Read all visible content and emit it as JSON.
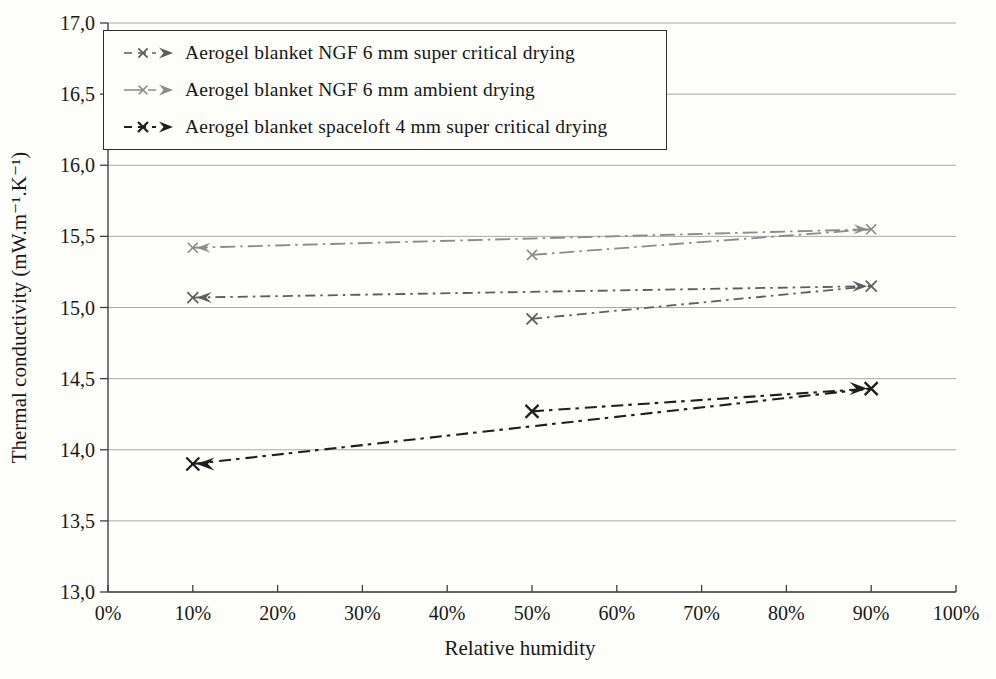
{
  "chart_data": {
    "type": "line",
    "title": "",
    "xlabel": "Relative humidity",
    "ylabel": "Thermal conductivity (mW.m⁻¹.K⁻¹)",
    "xlim": [
      0,
      100
    ],
    "ylim": [
      13.0,
      17.0
    ],
    "grid": "horizontal",
    "legend_position": "top-left",
    "x_ticks": {
      "values": [
        0,
        10,
        20,
        30,
        40,
        50,
        60,
        70,
        80,
        90,
        100
      ],
      "labels": [
        "0%",
        "10%",
        "20%",
        "30%",
        "40%",
        "50%",
        "60%",
        "70%",
        "80%",
        "90%",
        "100%"
      ]
    },
    "y_ticks": {
      "values": [
        17.0,
        16.5,
        16.0,
        15.5,
        15.0,
        14.5,
        14.0,
        13.5,
        13.0
      ],
      "labels": [
        "17,0",
        "16,5",
        "16,0",
        "15,5",
        "15,0",
        "14,5",
        "14,0",
        "13,5",
        "13,0"
      ]
    },
    "series": [
      {
        "name": "Aerogel blanket NGF 6 mm super critical drying",
        "color": "#5d5d5d",
        "marker": "x-with-direction-arrows",
        "x": [
          10,
          50,
          90
        ],
        "values": [
          15.07,
          14.92,
          15.15
        ],
        "segments": [
          [
            [
              10,
              15.07
            ],
            [
              90,
              15.15
            ]
          ],
          [
            [
              50,
              14.92
            ],
            [
              90,
              15.15
            ]
          ]
        ],
        "dash": [
          10,
          5,
          2.5,
          5
        ],
        "width": 1.8,
        "marker_size": 5.5,
        "marker_stroke": 1.7
      },
      {
        "name": "Aerogel blanket NGF 6 mm ambient drying",
        "color": "#8b8b8b",
        "marker": "x-with-direction-arrows",
        "x": [
          10,
          50,
          90
        ],
        "values": [
          15.42,
          15.37,
          15.55
        ],
        "segments": [
          [
            [
              10,
              15.42
            ],
            [
              90,
              15.55
            ]
          ],
          [
            [
              50,
              15.37
            ],
            [
              90,
              15.55
            ]
          ]
        ],
        "dash": [
          15,
          5,
          2.5,
          5
        ],
        "width": 1.8,
        "marker_size": 5,
        "marker_stroke": 1.7
      },
      {
        "name": "Aerogel blanket spaceloft 4 mm super critical drying",
        "color": "#1e1e1e",
        "marker": "x-with-direction-arrows",
        "x": [
          10,
          50,
          90
        ],
        "values": [
          13.9,
          14.27,
          14.43
        ],
        "segments": [
          [
            [
              10,
              13.9
            ],
            [
              90,
              14.43
            ]
          ],
          [
            [
              50,
              14.27
            ],
            [
              90,
              14.43
            ]
          ]
        ],
        "dash": [
          12,
          5,
          3.5,
          6
        ],
        "width": 2.1,
        "marker_size": 6.5,
        "marker_stroke": 2.3
      }
    ]
  }
}
